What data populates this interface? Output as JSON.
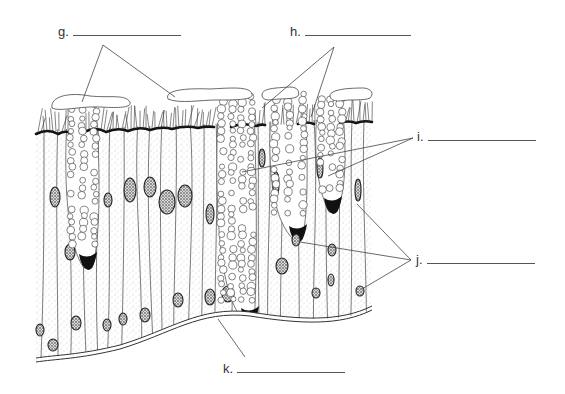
{
  "diagram": {
    "labels": [
      {
        "id": "g",
        "text": "g.",
        "answer": ""
      },
      {
        "id": "h",
        "text": "h.",
        "answer": ""
      },
      {
        "id": "i",
        "text": "i.",
        "answer": ""
      },
      {
        "id": "j",
        "text": "j.",
        "answer": ""
      },
      {
        "id": "k",
        "text": "k.",
        "answer": ""
      }
    ],
    "structures": [
      {
        "id": "mucus",
        "pointed_by": "g"
      },
      {
        "id": "cilia",
        "pointed_by": "h"
      },
      {
        "id": "goblet-cell",
        "pointed_by": "i"
      },
      {
        "id": "nucleus",
        "pointed_by": "j"
      },
      {
        "id": "basement-membrane",
        "pointed_by": "k"
      }
    ],
    "colors": {
      "ink": "#222222",
      "stipple": "#9a9a9a",
      "label": "#333333",
      "background": "#ffffff"
    }
  }
}
